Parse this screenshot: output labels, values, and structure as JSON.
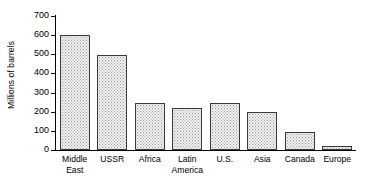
{
  "chart_data": {
    "type": "bar",
    "title": "",
    "subtitle": "",
    "xlabel": "",
    "ylabel": "Millions of barrels",
    "ylim": [
      0,
      700
    ],
    "yticks": [
      0,
      100,
      200,
      300,
      400,
      500,
      600,
      700
    ],
    "ytick_labels": [
      "0",
      "100",
      "200",
      "300",
      "400",
      "500",
      "600",
      "700"
    ],
    "grid": false,
    "legend": "none",
    "bar_fill_color": "#f2f2f2",
    "bar_edge_color": "#3a3a3a",
    "categories": [
      "Middle\nEast",
      "USSR",
      "Africa",
      "Latin\nAmerica",
      "U.S.",
      "Asia",
      "Canada",
      "Europe"
    ],
    "category_names": [
      "Middle East",
      "USSR",
      "Africa",
      "Latin America",
      "U.S.",
      "Asia",
      "Canada",
      "Europe"
    ],
    "values": [
      600,
      495,
      245,
      222,
      245,
      197,
      92,
      20
    ]
  }
}
